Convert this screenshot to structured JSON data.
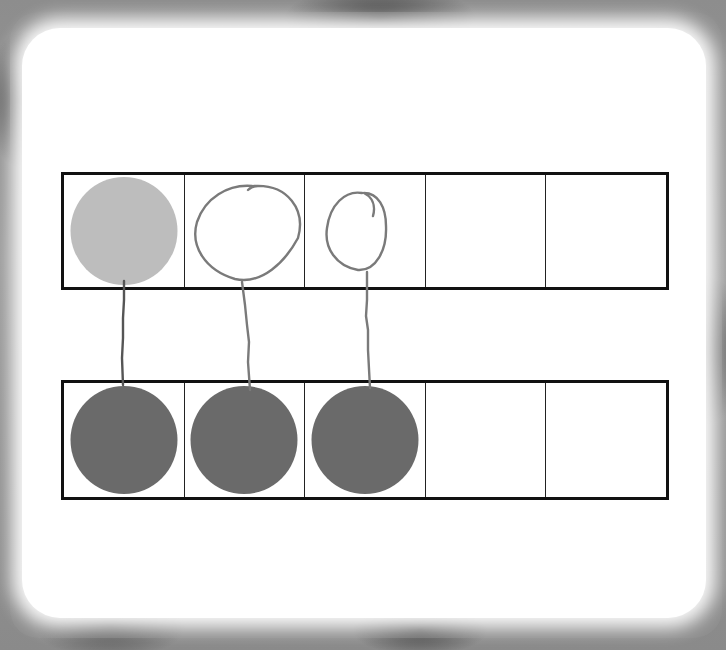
{
  "worksheet": {
    "type": "ten-frame one-to-one matching",
    "top_frame": {
      "cells": [
        {
          "index": 1,
          "content": "light-gray filled counter"
        },
        {
          "index": 2,
          "content": "hand-drawn circle"
        },
        {
          "index": 3,
          "content": "hand-drawn circle"
        },
        {
          "index": 4,
          "content": "empty"
        },
        {
          "index": 5,
          "content": "empty"
        }
      ],
      "filled_count": 1,
      "drawn_count": 2
    },
    "bottom_frame": {
      "cells": [
        {
          "index": 1,
          "content": "dark-gray filled counter"
        },
        {
          "index": 2,
          "content": "dark-gray filled counter"
        },
        {
          "index": 3,
          "content": "dark-gray filled counter"
        },
        {
          "index": 4,
          "content": "empty"
        },
        {
          "index": 5,
          "content": "empty"
        }
      ],
      "filled_count": 3
    },
    "matching_lines": [
      {
        "from_top_cell": 1,
        "to_bottom_cell": 1
      },
      {
        "from_top_cell": 2,
        "to_bottom_cell": 2
      },
      {
        "from_top_cell": 3,
        "to_bottom_cell": 3
      }
    ]
  },
  "colors": {
    "light_counter": "#bdbdbd",
    "dark_counter": "#6a6a6a",
    "pencil": "#7a7a7a",
    "frame_border": "#111111",
    "background_border": "#8d8d8d"
  }
}
